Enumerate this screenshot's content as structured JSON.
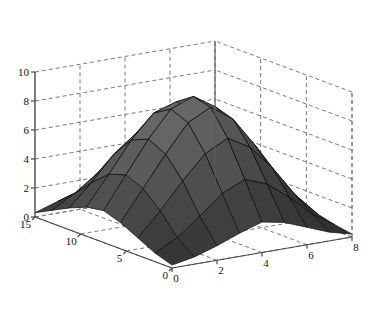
{
  "figure": {
    "type": "surface-plot-3d",
    "background": "#ffffff",
    "width": 375,
    "height": 315
  },
  "chart_data": {
    "type": "surface",
    "title": "",
    "xlabel": "",
    "ylabel": "",
    "zlabel": "",
    "grid": true,
    "legend": "none",
    "colormap": "grayscale",
    "surface_color_low": "#0a0a0a",
    "surface_color_high": "#8a8a8a",
    "edge_color": "#000000",
    "xlim": [
      0,
      8
    ],
    "ylim": [
      0,
      15
    ],
    "zlim": [
      0,
      10
    ],
    "x_ticks": [
      0,
      2,
      4,
      6,
      8
    ],
    "y_ticks": [
      0,
      5,
      10,
      15
    ],
    "z_ticks": [
      0,
      2,
      4,
      6,
      8,
      10
    ],
    "x_tick_labels": [
      "0",
      "2",
      "4",
      "6",
      "8"
    ],
    "y_tick_labels": [
      "0",
      "5",
      "10",
      "15"
    ],
    "z_tick_labels": [
      "0",
      "2",
      "4",
      "6",
      "8",
      "10"
    ],
    "x": [
      0,
      1,
      2,
      3,
      4,
      5,
      6,
      7,
      8
    ],
    "y": [
      0,
      1.875,
      3.75,
      5.625,
      7.5,
      9.375,
      11.25,
      13.125,
      15
    ],
    "z": [
      [
        0.2,
        0.5,
        1.0,
        1.6,
        2.1,
        1.8,
        1.2,
        0.6,
        0.2
      ],
      [
        0.6,
        1.4,
        2.6,
        3.9,
        4.6,
        4.0,
        2.8,
        1.4,
        0.4
      ],
      [
        1.2,
        2.8,
        4.6,
        6.2,
        7.0,
        6.1,
        4.4,
        2.3,
        0.7
      ],
      [
        1.8,
        3.9,
        6.0,
        7.9,
        8.7,
        7.6,
        5.5,
        2.9,
        0.9
      ],
      [
        2.2,
        4.4,
        6.6,
        8.4,
        9.0,
        8.0,
        5.9,
        3.1,
        1.0
      ],
      [
        2.0,
        4.0,
        6.1,
        7.7,
        8.2,
        7.2,
        5.2,
        2.7,
        0.8
      ],
      [
        1.5,
        3.0,
        4.7,
        5.9,
        6.3,
        5.5,
        3.9,
        2.0,
        0.6
      ],
      [
        0.9,
        1.8,
        2.9,
        3.7,
        4.0,
        3.4,
        2.4,
        1.2,
        0.4
      ],
      [
        0.3,
        0.8,
        1.3,
        1.7,
        1.9,
        1.6,
        1.1,
        0.5,
        0.2
      ]
    ],
    "peak_value": 9.0,
    "min_value": 0.2,
    "azimuth_deg": -37.5,
    "elevation_deg": 30
  },
  "axes": {
    "z_axis_name": "vertical-axis",
    "y_axis_name": "left-depth-axis",
    "x_axis_name": "right-width-axis"
  }
}
